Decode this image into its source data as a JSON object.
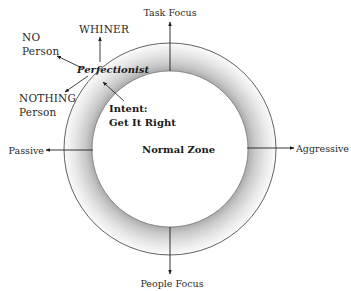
{
  "diagram": {
    "type": "behavior-zone-circle",
    "colors": {
      "ring_inner_shade": "#a8a8a8",
      "ring_outer_shade": "#ffffff",
      "outline": "#3a3a3a",
      "text": "#2a2a2a"
    },
    "axes": {
      "top": "Task Focus",
      "bottom": "People Focus",
      "left": "Passive",
      "right": "Aggressive"
    },
    "center_label": "Normal Zone",
    "zone_label": "Perfectionist",
    "intent": {
      "line1": "Intent:",
      "line2": "Get It Right"
    },
    "outcomes": {
      "up": "WHINER",
      "upper_left": {
        "line1": "NO",
        "line2": "Person"
      },
      "lower_left": {
        "line1": "NOTHING",
        "line2": "Person"
      }
    }
  }
}
